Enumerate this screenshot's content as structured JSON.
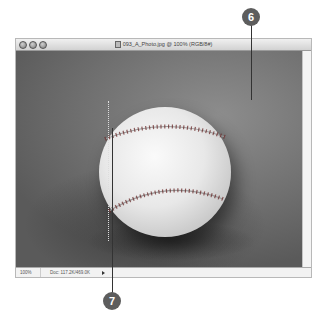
{
  "window": {
    "title": "093_A_Photo.jpg @ 100% (RGB/8#)",
    "traffic_lights": [
      "close",
      "minimize",
      "zoom"
    ]
  },
  "statusbar": {
    "zoom_level": "100%",
    "doc_info": "Doc: 117.2K/469.0K"
  },
  "canvas": {
    "subject": "baseball"
  },
  "callouts": [
    {
      "number": "6",
      "target": "canvas"
    },
    {
      "number": "7",
      "target": "selection-marquee"
    }
  ],
  "colors": {
    "callout_bg": "#5d5d5d",
    "callout_fg": "#ffffff"
  }
}
